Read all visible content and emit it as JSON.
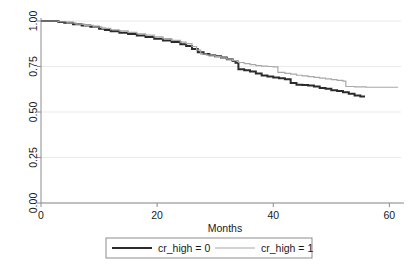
{
  "chart_data": {
    "type": "line",
    "subtype": "kaplan-meier-survival",
    "title": "",
    "xlabel": "Months",
    "ylabel": "",
    "xlim": [
      0,
      62
    ],
    "ylim": [
      0,
      1.0
    ],
    "xticks": [
      0,
      20,
      40,
      60
    ],
    "xticklabels": [
      "0",
      "20",
      "40",
      "60"
    ],
    "yticks": [
      0.0,
      0.25,
      0.5,
      0.75,
      1.0
    ],
    "yticklabels": [
      "0.00",
      "0.25",
      "0.50",
      "0.75",
      "1.00"
    ],
    "grid": "horizontal",
    "legend_position": "below-axes",
    "series": [
      {
        "name": "cr_high = 0",
        "color": "#2b2b2b",
        "width": 2.0,
        "points": [
          [
            0,
            1.0
          ],
          [
            1.5,
            1.0
          ],
          [
            3,
            0.995
          ],
          [
            4,
            0.99
          ],
          [
            5.5,
            0.982
          ],
          [
            7,
            0.975
          ],
          [
            8.5,
            0.968
          ],
          [
            10,
            0.958
          ],
          [
            11,
            0.95
          ],
          [
            12,
            0.944
          ],
          [
            13.5,
            0.936
          ],
          [
            15,
            0.928
          ],
          [
            16.5,
            0.92
          ],
          [
            18,
            0.912
          ],
          [
            19.5,
            0.903
          ],
          [
            21,
            0.893
          ],
          [
            22.5,
            0.884
          ],
          [
            24,
            0.872
          ],
          [
            25,
            0.862
          ],
          [
            26,
            0.846
          ],
          [
            27,
            0.828
          ],
          [
            28,
            0.818
          ],
          [
            29,
            0.812
          ],
          [
            30,
            0.806
          ],
          [
            31,
            0.8
          ],
          [
            32,
            0.79
          ],
          [
            33,
            0.78
          ],
          [
            33.5,
            0.77
          ],
          [
            34,
            0.735
          ],
          [
            35,
            0.73
          ],
          [
            36,
            0.722
          ],
          [
            37,
            0.712
          ],
          [
            38,
            0.7
          ],
          [
            39,
            0.695
          ],
          [
            40,
            0.69
          ],
          [
            41,
            0.685
          ],
          [
            42,
            0.68
          ],
          [
            43,
            0.66
          ],
          [
            44,
            0.65
          ],
          [
            45,
            0.648
          ],
          [
            46,
            0.645
          ],
          [
            47,
            0.64
          ],
          [
            48,
            0.632
          ],
          [
            49,
            0.628
          ],
          [
            50,
            0.62
          ],
          [
            51,
            0.615
          ],
          [
            52,
            0.608
          ],
          [
            53,
            0.6
          ],
          [
            54,
            0.59
          ],
          [
            55,
            0.585
          ],
          [
            55.8,
            0.585
          ]
        ]
      },
      {
        "name": "cr_high = 1",
        "color": "#a8a8a8",
        "width": 1.2,
        "points": [
          [
            0,
            1.0
          ],
          [
            1.5,
            1.0
          ],
          [
            3,
            0.996
          ],
          [
            4.5,
            0.99
          ],
          [
            6,
            0.983
          ],
          [
            7.5,
            0.976
          ],
          [
            9,
            0.968
          ],
          [
            10.5,
            0.96
          ],
          [
            12,
            0.952
          ],
          [
            13.5,
            0.946
          ],
          [
            15,
            0.938
          ],
          [
            16.5,
            0.93
          ],
          [
            18,
            0.922
          ],
          [
            19.5,
            0.913
          ],
          [
            21,
            0.903
          ],
          [
            22.5,
            0.894
          ],
          [
            24,
            0.884
          ],
          [
            25,
            0.876
          ],
          [
            26,
            0.86
          ],
          [
            26.8,
            0.84
          ],
          [
            27.5,
            0.818
          ],
          [
            28.5,
            0.812
          ],
          [
            30,
            0.804
          ],
          [
            31,
            0.798
          ],
          [
            32,
            0.79
          ],
          [
            33,
            0.782
          ],
          [
            34,
            0.772
          ],
          [
            35,
            0.766
          ],
          [
            36,
            0.76
          ],
          [
            37,
            0.755
          ],
          [
            38,
            0.752
          ],
          [
            39,
            0.75
          ],
          [
            40,
            0.748
          ],
          [
            40.8,
            0.718
          ],
          [
            42,
            0.712
          ],
          [
            43,
            0.708
          ],
          [
            44,
            0.702
          ],
          [
            45,
            0.698
          ],
          [
            46,
            0.694
          ],
          [
            47,
            0.69
          ],
          [
            48,
            0.686
          ],
          [
            49,
            0.682
          ],
          [
            50,
            0.678
          ],
          [
            51,
            0.674
          ],
          [
            52,
            0.67
          ],
          [
            52.5,
            0.64
          ],
          [
            54,
            0.638
          ],
          [
            56,
            0.636
          ],
          [
            58,
            0.636
          ],
          [
            60,
            0.636
          ],
          [
            61.5,
            0.636
          ]
        ]
      }
    ],
    "legend": [
      {
        "label": "cr_high = 0",
        "color": "#2b2b2b",
        "width": 2.0
      },
      {
        "label": "cr_high = 1",
        "color": "#a8a8a8",
        "width": 1.2
      }
    ]
  },
  "colors": {
    "axis": "#8c8c8c",
    "grid": "#e9e9e9",
    "text": "#1a1a1a",
    "legend_border": "#8c8c8c",
    "background": "#ffffff"
  }
}
